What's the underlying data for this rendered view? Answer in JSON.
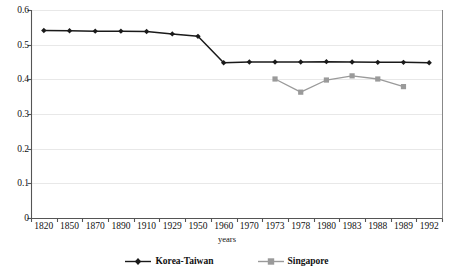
{
  "chart_data": {
    "type": "line",
    "title": "",
    "xlabel": "years",
    "ylabel": "",
    "categories": [
      "1820",
      "1850",
      "1870",
      "1890",
      "1910",
      "1929",
      "1950",
      "1960",
      "1970",
      "1973",
      "1978",
      "1980",
      "1983",
      "1988",
      "1989",
      "1992"
    ],
    "ylim": [
      0,
      0.6
    ],
    "yticks": [
      "0",
      "0.1",
      "0.2",
      "0.3",
      "0.4",
      "0.5",
      "0.6"
    ],
    "ytick_values": [
      0,
      0.1,
      0.2,
      0.3,
      0.4,
      0.5,
      0.6
    ],
    "grid": "horizontal",
    "legend_position": "bottom",
    "series": [
      {
        "name": "Korea-Taiwan",
        "color": "#1a1a1a",
        "marker": "diamond",
        "x": [
          "1820",
          "1850",
          "1870",
          "1890",
          "1910",
          "1929",
          "1950",
          "1960",
          "1970",
          "1973",
          "1978",
          "1980",
          "1983",
          "1988",
          "1989",
          "1992"
        ],
        "values": [
          0.541,
          0.54,
          0.539,
          0.539,
          0.538,
          0.531,
          0.524,
          0.448,
          0.45,
          0.45,
          0.45,
          0.451,
          0.45,
          0.449,
          0.449,
          0.448
        ]
      },
      {
        "name": "Singapore",
        "color": "#9a9a9a",
        "marker": "square",
        "x": [
          "1973",
          "1978",
          "1980",
          "1983",
          "1988",
          "1989"
        ],
        "values": [
          0.401,
          0.363,
          0.398,
          0.41,
          0.401,
          0.379
        ]
      }
    ]
  },
  "legend": {
    "items": [
      {
        "label": "Korea-Taiwan",
        "color": "#1a1a1a",
        "marker": "diamond"
      },
      {
        "label": "Singapore",
        "color": "#9a9a9a",
        "marker": "square"
      }
    ]
  },
  "axis": {
    "x_title": "years"
  },
  "colors": {
    "korea_taiwan": "#1a1a1a",
    "singapore": "#9a9a9a",
    "grid": "#e8e8e8",
    "axis": "#555555",
    "border": "#888888"
  }
}
